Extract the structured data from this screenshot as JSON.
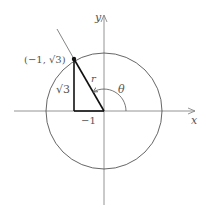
{
  "diagram": {
    "type": "polar-coordinates-reference-triangle",
    "axes": {
      "x_label": "x",
      "y_label": "y"
    },
    "point": {
      "label": "(−1, √3)",
      "x": -1,
      "y": "√3"
    },
    "triangle": {
      "vertical_side_label": "√3",
      "horizontal_side_label": "−1",
      "hypotenuse_label": "r"
    },
    "angle_label": "θ",
    "colors": {
      "axis": "#888888",
      "circle": "#555555",
      "triangle": "#111111",
      "ray": "#777777",
      "text": "#555555"
    }
  }
}
